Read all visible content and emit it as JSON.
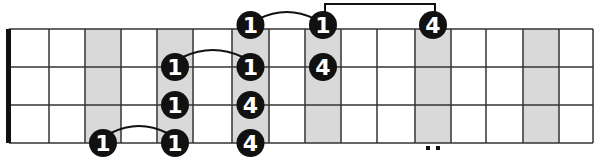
{
  "diagram": {
    "type": "guitar-fretboard",
    "orientation": "horizontal",
    "colors": {
      "background": "#ffffff",
      "shaded_fret": "#d9d9d9",
      "grid_line": "#333333",
      "nut": "#111111",
      "dot_fill": "#111111",
      "dot_text": "#ffffff"
    },
    "fret_lines_x": [
      9,
      49,
      85,
      121,
      157,
      193,
      232,
      269,
      305,
      341,
      377,
      415,
      451,
      486,
      523,
      559,
      593
    ],
    "string_lines_y": [
      29,
      67,
      105,
      143
    ],
    "shaded_columns": [
      2,
      4,
      6,
      8,
      11,
      14
    ],
    "notes": [
      {
        "string": 0,
        "column": 6,
        "label": "1"
      },
      {
        "string": 0,
        "column": 8,
        "label": "1"
      },
      {
        "string": 0,
        "column": 11,
        "label": "4"
      },
      {
        "string": 1,
        "column": 4,
        "label": "1"
      },
      {
        "string": 1,
        "column": 6,
        "label": "1"
      },
      {
        "string": 1,
        "column": 8,
        "label": "4"
      },
      {
        "string": 2,
        "column": 4,
        "label": "1"
      },
      {
        "string": 2,
        "column": 6,
        "label": "4"
      },
      {
        "string": 3,
        "column": 2,
        "label": "1"
      },
      {
        "string": 3,
        "column": 4,
        "label": "1"
      },
      {
        "string": 3,
        "column": 6,
        "label": "4"
      }
    ],
    "slurs": [
      {
        "string": 0,
        "from_column": 6,
        "to_column": 8,
        "type": "arc"
      },
      {
        "string": 1,
        "from_column": 4,
        "to_column": 6,
        "type": "arc"
      },
      {
        "string": 3,
        "from_column": 2,
        "to_column": 4,
        "type": "arc"
      },
      {
        "string": 0,
        "from_column": 8,
        "to_column": 11,
        "type": "bracket"
      }
    ],
    "position_marker": {
      "column": 11,
      "label": "double-dot"
    }
  }
}
